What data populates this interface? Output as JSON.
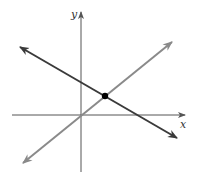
{
  "diagram": {
    "axes": {
      "x_label": "x",
      "y_label": "y",
      "origin_px": [
        81,
        115
      ]
    },
    "lines": [
      {
        "name": "decreasing-line",
        "color": "#3a3a3a",
        "from_px": [
          20,
          47
        ],
        "to_px": [
          177,
          138
        ]
      },
      {
        "name": "increasing-line",
        "color": "#8a8a8a",
        "from_px": [
          23,
          163
        ],
        "to_px": [
          172,
          42
        ]
      }
    ],
    "intersection_point": {
      "px": [
        105,
        96
      ],
      "color": "#000000"
    }
  }
}
